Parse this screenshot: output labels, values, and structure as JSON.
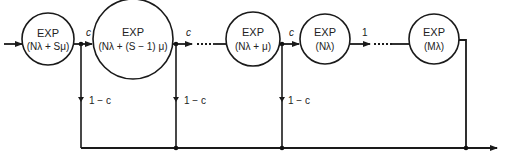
{
  "diagram": {
    "type": "queueing-network",
    "nodes": [
      {
        "id": "n1",
        "title": "EXP",
        "rate": "(Nλ + Sμ)",
        "cx": 48,
        "cy": 39,
        "r": 26
      },
      {
        "id": "n2",
        "title": "EXP",
        "rate": "(Nλ + (S − 1) μ)",
        "cx": 133,
        "cy": 39,
        "r": 40
      },
      {
        "id": "n3",
        "title": "EXP",
        "rate": "(Nλ + μ)",
        "cx": 253,
        "cy": 39,
        "r": 27
      },
      {
        "id": "n4",
        "title": "EXP",
        "rate": "(Nλ)",
        "cx": 325,
        "cy": 39,
        "r": 25
      },
      {
        "id": "n5",
        "title": "EXP",
        "rate": "(Mλ)",
        "cx": 434,
        "cy": 39,
        "r": 25
      }
    ],
    "labels": {
      "forward_c": "c",
      "forward_one": "1",
      "exit_branch": "1 − c"
    },
    "colors": {
      "line": "#1a1a1a",
      "background": "#ffffff"
    }
  }
}
